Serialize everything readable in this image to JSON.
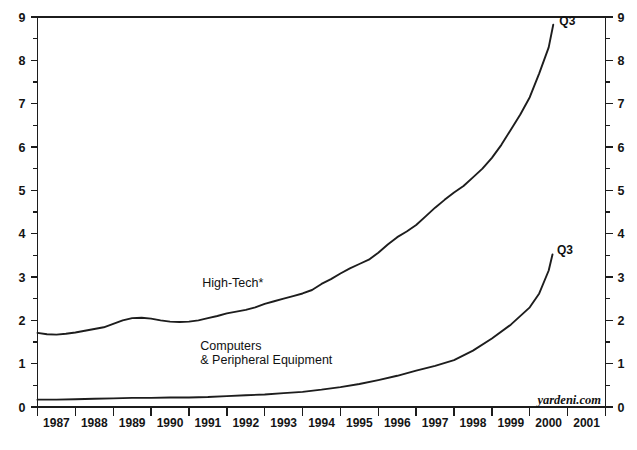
{
  "chart_data": {
    "type": "line",
    "title": "",
    "subtitle": "",
    "xlabel": "",
    "ylabel": "",
    "xlim": [
      1987,
      2002
    ],
    "ylim": [
      0,
      9
    ],
    "grid": false,
    "legend_position": "inline-annotations",
    "y_ticks_major": [
      0,
      1,
      2,
      3,
      4,
      5,
      6,
      7,
      8,
      9
    ],
    "y_tick_labels": [
      "0",
      "1",
      "2",
      "3",
      "4",
      "5",
      "6",
      "7",
      "8",
      "9"
    ],
    "y_minor_step": 0.5,
    "x_tick_labels": [
      "1987",
      "1988",
      "1989",
      "1990",
      "1991",
      "1992",
      "1993",
      "1994",
      "1995",
      "1996",
      "1997",
      "1998",
      "1999",
      "2000",
      "2001"
    ],
    "axis_left_label": "left",
    "axis_right_label": "right",
    "watermark": "yardeni.com",
    "series": [
      {
        "name": "High-Tech*",
        "label": "High-Tech*",
        "label_x": 1991.35,
        "label_y": 2.78,
        "end_annotation": "Q3",
        "end_annotation_x": 2000.78,
        "end_annotation_y": 8.82,
        "x": [
          1987.0,
          1987.25,
          1987.5,
          1987.75,
          1988.0,
          1988.25,
          1988.5,
          1988.75,
          1989.0,
          1989.25,
          1989.5,
          1989.75,
          1990.0,
          1990.25,
          1990.5,
          1990.75,
          1991.0,
          1991.25,
          1991.5,
          1991.75,
          1992.0,
          1992.25,
          1992.5,
          1992.75,
          1993.0,
          1993.25,
          1993.5,
          1993.75,
          1994.0,
          1994.25,
          1994.5,
          1994.75,
          1995.0,
          1995.25,
          1995.5,
          1995.75,
          1996.0,
          1996.25,
          1996.5,
          1996.75,
          1997.0,
          1997.25,
          1997.5,
          1997.75,
          1998.0,
          1998.25,
          1998.5,
          1998.75,
          1999.0,
          1999.25,
          1999.5,
          1999.75,
          2000.0,
          2000.25,
          2000.5,
          2000.62
        ],
        "values": [
          1.71,
          1.68,
          1.67,
          1.69,
          1.72,
          1.76,
          1.8,
          1.84,
          1.92,
          2.0,
          2.05,
          2.06,
          2.04,
          2.0,
          1.97,
          1.96,
          1.97,
          2.0,
          2.05,
          2.1,
          2.16,
          2.2,
          2.24,
          2.3,
          2.38,
          2.44,
          2.5,
          2.56,
          2.62,
          2.7,
          2.84,
          2.95,
          3.08,
          3.2,
          3.3,
          3.4,
          3.56,
          3.75,
          3.92,
          4.05,
          4.2,
          4.4,
          4.6,
          4.78,
          4.95,
          5.1,
          5.3,
          5.5,
          5.75,
          6.05,
          6.4,
          6.75,
          7.15,
          7.7,
          8.3,
          8.82
        ]
      },
      {
        "name": "Computers & Peripheral Equipment",
        "label_line1": "Computers",
        "label_line2": "& Peripheral Equipment",
        "label_x": 1991.3,
        "label_y": 1.32,
        "end_annotation": "Q3",
        "end_annotation_x": 2000.72,
        "end_annotation_y": 3.52,
        "x": [
          1987.0,
          1987.5,
          1988.0,
          1988.5,
          1989.0,
          1989.5,
          1990.0,
          1990.5,
          1991.0,
          1991.5,
          1992.0,
          1992.5,
          1993.0,
          1993.5,
          1994.0,
          1994.5,
          1995.0,
          1995.5,
          1996.0,
          1996.5,
          1997.0,
          1997.5,
          1998.0,
          1998.5,
          1999.0,
          1999.5,
          2000.0,
          2000.25,
          2000.5,
          2000.6
        ],
        "values": [
          0.17,
          0.17,
          0.18,
          0.19,
          0.2,
          0.21,
          0.21,
          0.22,
          0.22,
          0.23,
          0.25,
          0.27,
          0.29,
          0.32,
          0.35,
          0.4,
          0.46,
          0.53,
          0.62,
          0.72,
          0.84,
          0.95,
          1.08,
          1.3,
          1.58,
          1.9,
          2.3,
          2.62,
          3.15,
          3.52
        ]
      }
    ]
  },
  "footer": {
    "note": ""
  }
}
